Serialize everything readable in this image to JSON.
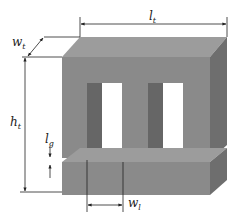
{
  "diagram": {
    "type": "E-I transformer core 3D illustration",
    "colors": {
      "front_face": "#8a8a8a",
      "top_face": "#9c9c9c",
      "right_face": "#6e6e6e",
      "window_inner_face": "#666666",
      "window": "#ffffff",
      "dimension_line": "#222222",
      "gap_line": "#c8c8c8"
    },
    "labels": {
      "lt": {
        "main": "l",
        "sub": "t"
      },
      "wt": {
        "main": "w",
        "sub": "t"
      },
      "ht": {
        "main": "h",
        "sub": "t"
      },
      "lg": {
        "main": "l",
        "sub": "g"
      },
      "wl": {
        "main": "w",
        "sub": "l"
      }
    }
  }
}
